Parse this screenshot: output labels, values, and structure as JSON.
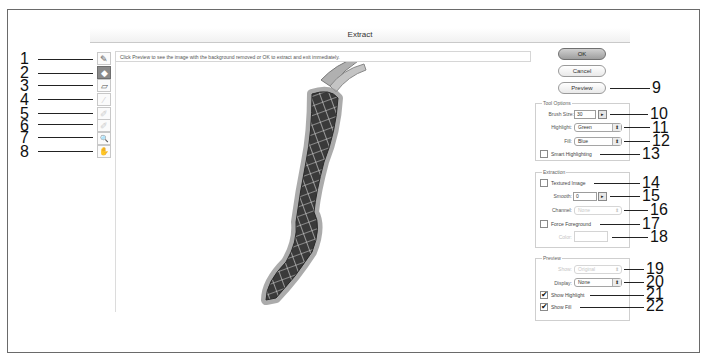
{
  "window": {
    "title": "Extract"
  },
  "hint": "Click Preview to see the image with the background removed or OK to extract and exit immediately.",
  "tools": [
    {
      "id": 1,
      "name": "edge-highlighter-tool",
      "glyph": "✎",
      "state": "normal"
    },
    {
      "id": 2,
      "name": "fill-tool",
      "glyph": "◆",
      "state": "active"
    },
    {
      "id": 3,
      "name": "eraser-tool",
      "glyph": "▱",
      "state": "normal"
    },
    {
      "id": 4,
      "name": "eyedropper-tool",
      "glyph": "⁄",
      "state": "disabled"
    },
    {
      "id": 5,
      "name": "cleanup-tool",
      "glyph": "✐",
      "state": "disabled"
    },
    {
      "id": 6,
      "name": "edge-touchup-tool",
      "glyph": "✐",
      "state": "disabled"
    },
    {
      "id": 7,
      "name": "zoom-tool",
      "glyph": "🔍",
      "state": "normal"
    },
    {
      "id": 8,
      "name": "hand-tool",
      "glyph": "✋",
      "state": "normal"
    }
  ],
  "buttons": {
    "ok": "OK",
    "cancel": "Cancel",
    "preview": "Preview"
  },
  "tool_options": {
    "title": "Tool Options",
    "brush_size_label": "Brush Size:",
    "brush_size_value": "30",
    "highlight_label": "Highlight:",
    "highlight_value": "Green",
    "fill_label": "Fill:",
    "fill_value": "Blue",
    "smart_highlighting_label": "Smart Highlighting",
    "smart_highlighting_checked": false
  },
  "extraction": {
    "title": "Extraction",
    "textured_image_label": "Textured Image",
    "textured_image_checked": false,
    "smooth_label": "Smooth:",
    "smooth_value": "0",
    "channel_label": "Channel:",
    "channel_value": "None",
    "force_foreground_label": "Force Foreground",
    "force_foreground_checked": false,
    "color_label": "Color:"
  },
  "preview": {
    "title": "Preview",
    "show_label": "Show:",
    "show_value": "Original",
    "display_label": "Display:",
    "display_value": "None",
    "show_highlight_label": "Show Highlight",
    "show_highlight_checked": true,
    "show_fill_label": "Show Fill",
    "show_fill_checked": true
  },
  "callouts": {
    "c1": "1",
    "c2": "2",
    "c3": "3",
    "c4": "4",
    "c5": "5",
    "c6": "6",
    "c7": "7",
    "c8": "8",
    "c9": "9",
    "c10": "10",
    "c11": "11",
    "c12": "12",
    "c13": "13",
    "c14": "14",
    "c15": "15",
    "c16": "16",
    "c17": "17",
    "c18": "18",
    "c19": "19",
    "c20": "20",
    "c21": "21",
    "c22": "22"
  },
  "glyphs": {
    "dropdown": "⬍",
    "stepper": "▸",
    "check": "✔"
  },
  "colors": {
    "highlight_halo": "#9c9c9c",
    "object_dark": "#3a3a3a",
    "object_grid": "#d8d8d8"
  }
}
